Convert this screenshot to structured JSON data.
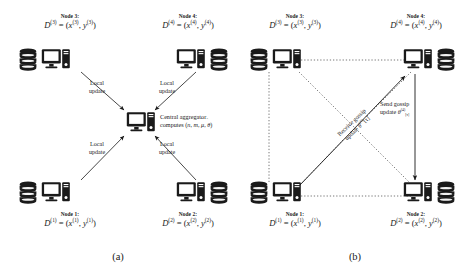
{
  "figure": {
    "type": "diagram",
    "background_color": "#ffffff",
    "ink_color": "#1a1a1a"
  },
  "panels": [
    {
      "id": "a",
      "caption": "(a)",
      "topology": "star",
      "nodes": [
        {
          "id": "node3",
          "title": "Node 3:",
          "dataset": "D",
          "index": "(3)",
          "equation_x": "x",
          "equation_y": "y",
          "position": "top-left",
          "icons": [
            "database-icon",
            "computer-icon"
          ]
        },
        {
          "id": "node4",
          "title": "Node 4:",
          "dataset": "D",
          "index": "(4)",
          "equation_x": "x",
          "equation_y": "y",
          "position": "top-right",
          "icons": [
            "computer-icon",
            "database-icon"
          ]
        },
        {
          "id": "node1",
          "title": "Node 1:",
          "dataset": "D",
          "index": "(1)",
          "equation_x": "x",
          "equation_y": "y",
          "position": "bottom-left",
          "icons": [
            "database-icon",
            "computer-icon"
          ]
        },
        {
          "id": "node2",
          "title": "Node 2:",
          "dataset": "D",
          "index": "(2)",
          "equation_x": "x",
          "equation_y": "y",
          "position": "bottom-right",
          "icons": [
            "computer-icon",
            "database-icon"
          ]
        }
      ],
      "center": {
        "id": "central-aggregator",
        "icon": "computer-icon",
        "label_line1": "Central aggregator",
        "label_line2_prefix": "computes (",
        "label_line2_params": [
          "n",
          "m",
          "μ",
          "θ"
        ],
        "label_line2_suffix": ")",
        "params_have_hats": true
      },
      "edges": [
        {
          "from": "node3",
          "to": "central-aggregator",
          "style": "solid",
          "arrow": "single",
          "label": "Local\nupdate",
          "label_line1": "Local",
          "label_line2": "update"
        },
        {
          "from": "node4",
          "to": "central-aggregator",
          "style": "solid",
          "arrow": "single",
          "label_line1": "Local",
          "label_line2": "update"
        },
        {
          "from": "node1",
          "to": "central-aggregator",
          "style": "solid",
          "arrow": "single",
          "label_line1": "Local",
          "label_line2": "update"
        },
        {
          "from": "node2",
          "to": "central-aggregator",
          "style": "solid",
          "arrow": "single",
          "label_line1": "Local",
          "label_line2": "update"
        }
      ]
    },
    {
      "id": "b",
      "caption": "(b)",
      "topology": "fully-connected-gossip",
      "nodes": [
        {
          "id": "node3",
          "title": "Node 3:",
          "dataset": "D",
          "index": "(3)",
          "equation_x": "x",
          "equation_y": "y",
          "position": "top-left",
          "icons": [
            "database-icon",
            "computer-icon"
          ]
        },
        {
          "id": "node4",
          "title": "Node 4:",
          "dataset": "D",
          "index": "(4)",
          "equation_x": "x",
          "equation_y": "y",
          "position": "top-right",
          "icons": [
            "computer-icon",
            "database-icon"
          ]
        },
        {
          "id": "node1",
          "title": "Node 1:",
          "dataset": "D",
          "index": "(1)",
          "equation_x": "x",
          "equation_y": "y",
          "position": "bottom-left",
          "icons": [
            "database-icon",
            "computer-icon"
          ]
        },
        {
          "id": "node2",
          "title": "Node 2:",
          "dataset": "D",
          "index": "(2)",
          "equation_x": "x",
          "equation_y": "y",
          "position": "bottom-right",
          "icons": [
            "computer-icon",
            "database-icon"
          ]
        }
      ],
      "edges": [
        {
          "from": "node3",
          "to": "node4",
          "style": "dotted",
          "arrow": "none"
        },
        {
          "from": "node3",
          "to": "node1",
          "style": "dotted",
          "arrow": "none"
        },
        {
          "from": "node1",
          "to": "node2",
          "style": "dotted",
          "arrow": "none"
        },
        {
          "from": "node3",
          "to": "node2",
          "style": "dotted",
          "arrow": "none"
        },
        {
          "from": "node4",
          "to": "node1",
          "style": "dotted",
          "arrow": "none"
        },
        {
          "from": "node1",
          "to": "node4",
          "style": "solid",
          "arrow": "single",
          "label_line1": "Receive gossip",
          "label_line2_prefix": "update ",
          "label_line2_symbol": "θ",
          "label_line2_index": "(4)",
          "label_line2_time": "[τ]",
          "rotated": true,
          "rotation_deg": -44
        },
        {
          "from": "node4",
          "to": "node2",
          "style": "solid",
          "arrow": "single",
          "label_line1": "Send gossip",
          "label_line2_prefix": "update ",
          "label_line2_symbol": "θ",
          "label_line2_index": "(4)",
          "label_line2_time": "[τ]",
          "rotated": false
        }
      ]
    }
  ],
  "labels": {
    "local_update_line1": "Local",
    "local_update_line2": "update",
    "central_line1": "Central aggregator",
    "central_line2_prefix": "computes (",
    "central_line2_suffix": ")",
    "receive_gossip_line1": "Receive gossip",
    "send_gossip_line1": "Send gossip",
    "update_prefix": "update ",
    "theta": "θ",
    "tau": "[τ]",
    "superscript_4": "(4)",
    "dataset_symbol": "D",
    "x_symbol": "x",
    "y_symbol": "y",
    "caption_a": "(a)",
    "caption_b": "(b)",
    "node1_title": "Node 1:",
    "node2_title": "Node 2:",
    "node3_title": "Node 3:",
    "node4_title": "Node 4:",
    "index1": "(1)",
    "index2": "(2)",
    "index3": "(3)",
    "index4": "(4)",
    "param_n": "n",
    "param_m": "m",
    "param_mu": "μ",
    "param_theta": "θ"
  }
}
